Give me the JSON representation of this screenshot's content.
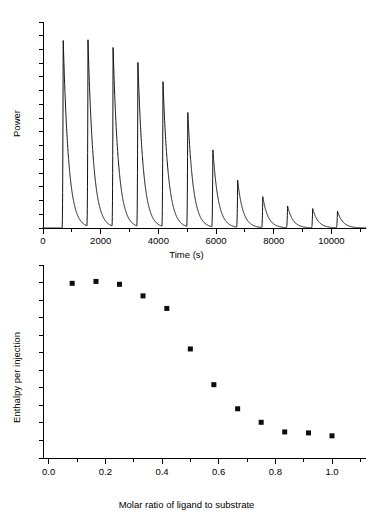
{
  "figure": {
    "title": "",
    "background_color": "#ffffff",
    "ink_color": "#000000",
    "marker_color": "#0d0d0d"
  },
  "chart_data": [
    {
      "type": "line",
      "panel": "top",
      "title": "",
      "xlabel": "Time (s)",
      "ylabel": "Power",
      "xlim": [
        0,
        11200
      ],
      "ylim": [
        0,
        1.0
      ],
      "grid": false,
      "legend": "none",
      "x_major_ticks": [
        0,
        2000,
        4000,
        6000,
        8000,
        10000
      ],
      "x_tick_labels": [
        "0",
        "2000",
        "4000",
        "6000",
        "8000",
        "10000"
      ],
      "x_minor_tick_step": 1000,
      "y_tick_labels": [],
      "y_minor_tick_count": 15,
      "description": "Raw ITC thermogram: twelve exothermic injection spikes of decreasing amplitude on a flat baseline.",
      "peaks": [
        {
          "injection": 1,
          "time_s": 700,
          "amplitude": 0.92
        },
        {
          "injection": 2,
          "time_s": 1560,
          "amplitude": 0.905
        },
        {
          "injection": 3,
          "time_s": 2430,
          "amplitude": 0.868
        },
        {
          "injection": 4,
          "time_s": 3290,
          "amplitude": 0.8
        },
        {
          "injection": 5,
          "time_s": 4160,
          "amplitude": 0.707
        },
        {
          "injection": 6,
          "time_s": 5020,
          "amplitude": 0.56
        },
        {
          "injection": 7,
          "time_s": 5890,
          "amplitude": 0.378
        },
        {
          "injection": 8,
          "time_s": 6750,
          "amplitude": 0.228
        },
        {
          "injection": 9,
          "time_s": 7620,
          "amplitude": 0.15
        },
        {
          "injection": 10,
          "time_s": 8480,
          "amplitude": 0.106
        },
        {
          "injection": 11,
          "time_s": 9350,
          "amplitude": 0.094
        },
        {
          "injection": 12,
          "time_s": 10210,
          "amplitude": 0.082
        }
      ],
      "peak_rise_s": 40,
      "peak_decay_s": 185,
      "baseline": 0.0
    },
    {
      "type": "scatter",
      "panel": "bottom",
      "title": "",
      "xlabel": "Molar ratio of ligand to substrate",
      "ylabel": "Enthalpy per injection",
      "xlim": [
        -0.02,
        1.12
      ],
      "ylim": [
        0,
        1.0
      ],
      "grid": false,
      "legend": "none",
      "marker": "square",
      "marker_size_px": 5,
      "x_major_ticks": [
        0.0,
        0.2,
        0.4,
        0.6,
        0.8,
        1.0
      ],
      "x_tick_labels": [
        "0.0",
        "0.2",
        "0.4",
        "0.6",
        "0.8",
        "1.0"
      ],
      "x_minor_tick_step": 0.1,
      "y_tick_labels": [],
      "y_minor_tick_count": 11,
      "description": "Integrated ITC binding isotherm: sigmoidal decrease of enthalpy per injection with molar ratio.",
      "x": [
        0.083,
        0.167,
        0.25,
        0.333,
        0.417,
        0.5,
        0.583,
        0.667,
        0.75,
        0.833,
        0.917,
        1.0
      ],
      "values": [
        0.905,
        0.915,
        0.9,
        0.84,
        0.775,
        0.565,
        0.38,
        0.255,
        0.185,
        0.135,
        0.13,
        0.115
      ]
    }
  ]
}
